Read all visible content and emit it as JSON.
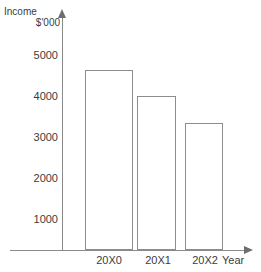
{
  "chart_data": {
    "type": "bar",
    "title": "",
    "ylabel": "Income $'000",
    "ylabel_line1": "Income",
    "ylabel_line2": "$'000",
    "xlabel": "Year",
    "categories": [
      "20X0",
      "20X1",
      "20X2"
    ],
    "values": [
      4400,
      3750,
      3100
    ],
    "ylim": [
      0,
      5400
    ],
    "yticks": [
      1000,
      2000,
      3000,
      4000,
      5000
    ],
    "ytick_labels": [
      "1000",
      "2000",
      "3000",
      "4000",
      "5000"
    ],
    "grid": false,
    "legend": null,
    "series": [
      {
        "name": "Income",
        "values": [
          4400,
          3750,
          3100
        ]
      }
    ],
    "colors": {
      "bar_fill": "#ffffff",
      "bar_stroke": "#8d8d8d",
      "axis": "#8a8a8a",
      "text": "#3c3c3c",
      "background": "#ffffff"
    }
  }
}
